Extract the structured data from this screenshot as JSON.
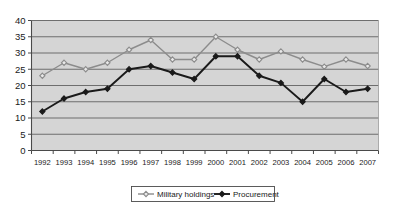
{
  "chart_data": {
    "type": "line",
    "title": "",
    "xlabel": "",
    "ylabel": "",
    "ylim": [
      0,
      40
    ],
    "ytick_step": 5,
    "yticks": [
      "0",
      "5",
      "10",
      "15",
      "20",
      "25",
      "30",
      "35",
      "40"
    ],
    "grid": true,
    "grid_axis": "y",
    "legend_position": "bottom-center",
    "categories": [
      "1992",
      "1993",
      "1994",
      "1995",
      "1996",
      "1997",
      "1998",
      "1999",
      "2000",
      "2001",
      "2002",
      "2003",
      "2004",
      "2005",
      "2006",
      "2007"
    ],
    "series": [
      {
        "name": "Military holdings",
        "marker": "open-diamond",
        "color": "#8c8c8c",
        "values": [
          23,
          27,
          25,
          27,
          31,
          34,
          28,
          28,
          35,
          31,
          28,
          30.5,
          28,
          25.8,
          28,
          26
        ]
      },
      {
        "name": "Procurement",
        "marker": "filled-diamond",
        "color": "#1a1a1a",
        "values": [
          12,
          16,
          18,
          19,
          25,
          26,
          24,
          22,
          29,
          29,
          23,
          20.8,
          15,
          22,
          18,
          19
        ]
      }
    ]
  },
  "plot": {
    "background_color": "#d5d5d5",
    "gridline_color": "#6e6e6e",
    "axis_color": "#4a4a4a",
    "border_color": "#9a9a9a"
  },
  "legend": {
    "entries": [
      {
        "label": "Military holdings"
      },
      {
        "label": "Procurement"
      }
    ]
  },
  "clipped_header": {
    "text": ""
  }
}
